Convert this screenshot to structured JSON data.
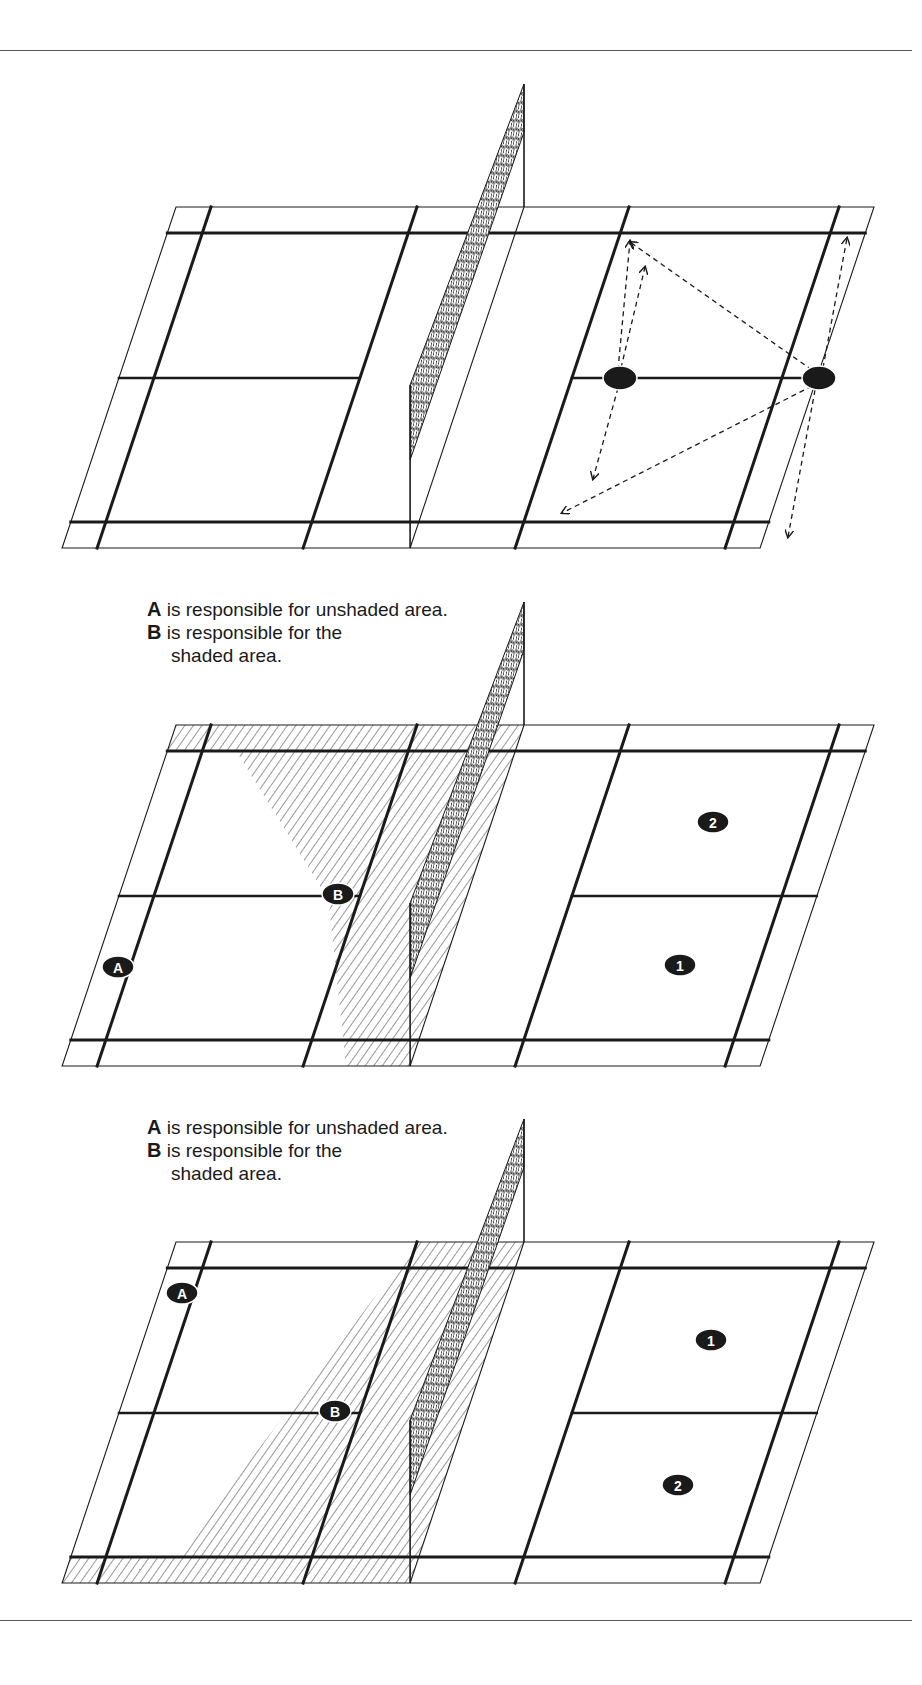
{
  "figure": {
    "rules": {
      "top_y": 50,
      "bottom_y": 1620
    },
    "colors": {
      "ink": "#1a1a1a",
      "paper": "#ffffff",
      "dot": "#1a1a1a",
      "rule": "#555555"
    },
    "court_geometry": {
      "width": 698,
      "depth": 341,
      "skew_per_px": 0.334,
      "lines": {
        "back_service_y": 26,
        "center_y": 171,
        "front_service_y": 315,
        "inner_left_x": 35,
        "inner_right_x": 663,
        "short_service_left_x": 241,
        "net_x": 348,
        "short_service_right_x": 453
      }
    },
    "panels": [
      {
        "id": "panel-1",
        "origin": [
          176,
          207
        ],
        "caption": null,
        "players": [
          {
            "label": "",
            "pos": [
              620,
              378
            ]
          },
          {
            "label": "",
            "pos": [
              819,
              378
            ]
          }
        ],
        "arrows": [
          {
            "from": [
              618,
              370
            ],
            "to": [
              630,
              241
            ]
          },
          {
            "from": [
              621,
              368
            ],
            "to": [
              645,
              267
            ]
          },
          {
            "from": [
              618,
              388
            ],
            "to": [
              593,
              479
            ]
          },
          {
            "from": [
              812,
              386
            ],
            "to": [
              562,
              513
            ]
          },
          {
            "from": [
              812,
              370
            ],
            "to": [
              630,
              242
            ]
          },
          {
            "from": [
              823,
              368
            ],
            "to": [
              847,
              238
            ]
          },
          {
            "from": [
              815,
              390
            ],
            "to": [
              788,
              537
            ]
          }
        ]
      },
      {
        "id": "panel-2",
        "origin": [
          176,
          725
        ],
        "caption": {
          "top": 598,
          "lines": [
            {
              "key": "A",
              "text": " is responsible for unshaded area."
            },
            {
              "key": "B",
              "text": " is responsible for the"
            },
            {
              "key": "",
              "text": "shaded area."
            }
          ]
        },
        "players": [
          {
            "label": "A",
            "pos": [
              118,
              967
            ]
          },
          {
            "label": "B",
            "pos": [
              338,
              894
            ]
          },
          {
            "label": "2",
            "pos": [
              713,
              822
            ]
          },
          {
            "label": "1",
            "pos": [
              680,
              965
            ]
          }
        ]
      },
      {
        "id": "panel-3",
        "origin": [
          176,
          1242
        ],
        "caption": {
          "top": 1116,
          "lines": [
            {
              "key": "A",
              "text": " is responsible for unshaded area."
            },
            {
              "key": "B",
              "text": " is responsible for the"
            },
            {
              "key": "",
              "text": "shaded area."
            }
          ]
        },
        "players": [
          {
            "label": "A",
            "pos": [
              182,
              1293
            ]
          },
          {
            "label": "B",
            "pos": [
              335,
              1411
            ]
          },
          {
            "label": "1",
            "pos": [
              711,
              1340
            ]
          },
          {
            "label": "2",
            "pos": [
              678,
              1485
            ]
          }
        ]
      }
    ]
  }
}
